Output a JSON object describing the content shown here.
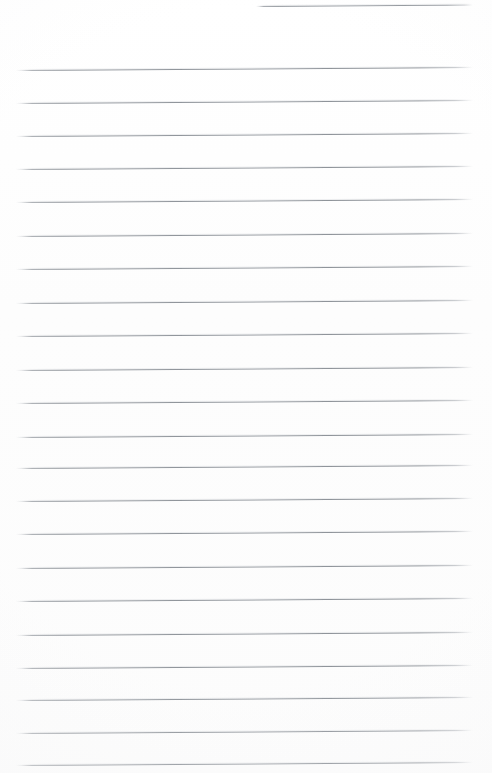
{
  "document": {
    "kind": "scanned-lined-paper",
    "title": "Blank ruled notebook page",
    "page_width": 492,
    "page_height": 773,
    "background_color": "#fefefe",
    "rule_color": "#8e9399",
    "rule_thickness_px": 1,
    "rule_spacing_px": 33.1,
    "rule_tilt_deg": -0.37,
    "has_text": false,
    "has_margin_rule": false,
    "written_content": "",
    "lines": [
      {
        "index": 1,
        "y": 6,
        "x_start": 256,
        "x_end": 473,
        "partial": true
      },
      {
        "index": 2,
        "y": 70,
        "x_start": 16,
        "x_end": 473,
        "partial": false
      },
      {
        "index": 3,
        "y": 103,
        "x_start": 16,
        "x_end": 473,
        "partial": false
      },
      {
        "index": 4,
        "y": 136,
        "x_start": 16,
        "x_end": 473,
        "partial": false
      },
      {
        "index": 5,
        "y": 169,
        "x_start": 16,
        "x_end": 473,
        "partial": false
      },
      {
        "index": 6,
        "y": 202,
        "x_start": 16,
        "x_end": 473,
        "partial": false
      },
      {
        "index": 7,
        "y": 236,
        "x_start": 16,
        "x_end": 473,
        "partial": false
      },
      {
        "index": 8,
        "y": 269,
        "x_start": 16,
        "x_end": 473,
        "partial": false
      },
      {
        "index": 9,
        "y": 303,
        "x_start": 16,
        "x_end": 473,
        "partial": false
      },
      {
        "index": 10,
        "y": 336,
        "x_start": 16,
        "x_end": 473,
        "partial": false
      },
      {
        "index": 11,
        "y": 370,
        "x_start": 16,
        "x_end": 473,
        "partial": false
      },
      {
        "index": 12,
        "y": 403,
        "x_start": 16,
        "x_end": 473,
        "partial": false
      },
      {
        "index": 13,
        "y": 437,
        "x_start": 16,
        "x_end": 473,
        "partial": false
      },
      {
        "index": 14,
        "y": 468,
        "x_start": 16,
        "x_end": 473,
        "partial": false
      },
      {
        "index": 15,
        "y": 501,
        "x_start": 16,
        "x_end": 473,
        "partial": false
      },
      {
        "index": 16,
        "y": 534,
        "x_start": 16,
        "x_end": 473,
        "partial": false
      },
      {
        "index": 17,
        "y": 568,
        "x_start": 16,
        "x_end": 473,
        "partial": false
      },
      {
        "index": 18,
        "y": 601,
        "x_start": 16,
        "x_end": 473,
        "partial": false
      },
      {
        "index": 19,
        "y": 635,
        "x_start": 16,
        "x_end": 473,
        "partial": false
      },
      {
        "index": 20,
        "y": 668,
        "x_start": 16,
        "x_end": 473,
        "partial": false
      },
      {
        "index": 21,
        "y": 700,
        "x_start": 16,
        "x_end": 473,
        "partial": false
      },
      {
        "index": 22,
        "y": 733,
        "x_start": 16,
        "x_end": 473,
        "partial": false
      },
      {
        "index": 23,
        "y": 765,
        "x_start": 16,
        "x_end": 473,
        "partial": false
      }
    ]
  }
}
